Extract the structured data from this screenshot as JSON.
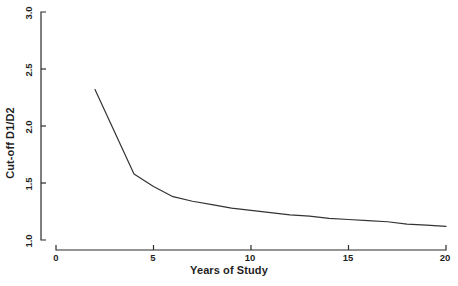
{
  "chart_data": {
    "type": "line",
    "title": "",
    "xlabel": "Years of Study",
    "ylabel": "Cut-off D1/D2",
    "xlim": [
      0,
      20
    ],
    "ylim": [
      1.0,
      3.0
    ],
    "xticks": [
      "0",
      "5",
      "10",
      "15",
      "20"
    ],
    "xtick_values": [
      0,
      5,
      10,
      15,
      20
    ],
    "yticks": [
      "1.0",
      "1.5",
      "2.0",
      "2.5",
      "3.0"
    ],
    "ytick_values": [
      1.0,
      1.5,
      2.0,
      2.5,
      3.0
    ],
    "grid": false,
    "legend": null,
    "series": [
      {
        "name": "Cut-off D1/D2",
        "color": "#333333",
        "x": [
          2,
          4,
          5,
          6,
          7,
          8,
          9,
          10,
          11,
          12,
          13,
          14,
          15,
          16,
          17,
          18,
          19,
          20
        ],
        "values": [
          2.32,
          1.58,
          1.47,
          1.38,
          1.34,
          1.31,
          1.28,
          1.26,
          1.24,
          1.22,
          1.21,
          1.19,
          1.18,
          1.17,
          1.16,
          1.14,
          1.13,
          1.12
        ]
      }
    ]
  },
  "axes": {
    "y_axis_name": "y-axis",
    "x_axis_name": "x-axis"
  }
}
